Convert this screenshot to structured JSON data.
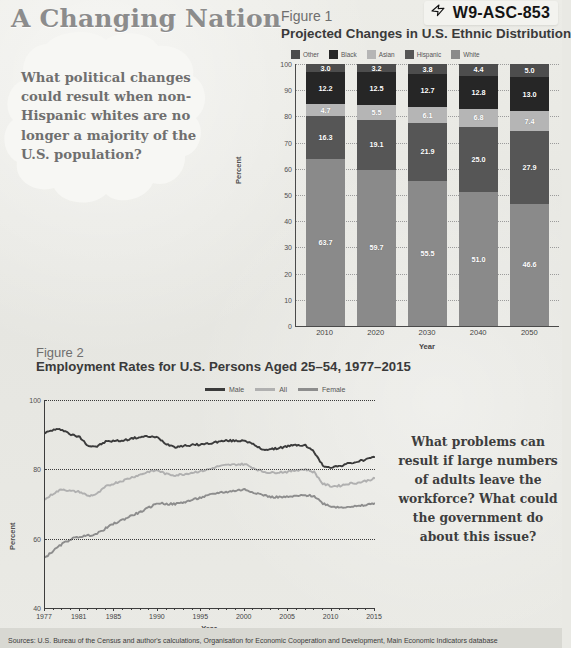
{
  "header": {
    "title": "A Changing Nation",
    "code_badge": {
      "icon": "pointing-hand-icon",
      "text": "W9-ASC-853"
    }
  },
  "bubble": {
    "question": "What political changes could result when non-Hispanic whites are no longer a majority of the U.S. population?"
  },
  "figure1": {
    "number": "Figure 1",
    "title": "Projected Changes in U.S. Ethnic Distribution",
    "legend": [
      {
        "label": "Other",
        "color": "#4d4d4d"
      },
      {
        "label": "Black",
        "color": "#262626"
      },
      {
        "label": "Asian",
        "color": "#b5b5b5"
      },
      {
        "label": "Hispanic",
        "color": "#565656"
      },
      {
        "label": "White",
        "color": "#8a8a8a"
      }
    ],
    "ylabel": "Percent",
    "xlabel": "Year",
    "yticks": [
      "100",
      "90",
      "80",
      "70",
      "60",
      "50",
      "40",
      "30",
      "20",
      "10",
      "0"
    ]
  },
  "figure2": {
    "number": "Figure 2",
    "title": "Employment Rates for U.S. Persons Aged 25–54, 1977–2015",
    "legend": [
      {
        "label": "Male",
        "color": "#3b3b3b"
      },
      {
        "label": "All",
        "color": "#b0b0b0"
      },
      {
        "label": "Female",
        "color": "#8d8d8d"
      }
    ],
    "ylabel": "Percent",
    "xlabel": "Year",
    "yticks": [
      "100",
      "80",
      "60",
      "40"
    ],
    "xticks": [
      "1977",
      "1981",
      "1985",
      "1990",
      "1995",
      "2000",
      "2005",
      "2010",
      "2015"
    ]
  },
  "question2": "What problems can result if large numbers of adults leave the workforce? What could the government do about this issue?",
  "sources": "Sources: U.S. Bureau of the Census and author's calculations, Organisation for Economic Cooperation and Development, Main Economic Indicators database",
  "chart_data": [
    {
      "type": "bar",
      "stacked": true,
      "title": "Projected Changes in U.S. Ethnic Distribution",
      "xlabel": "Year",
      "ylabel": "Percent",
      "ylim": [
        0,
        100
      ],
      "grid": true,
      "legend_position": "top",
      "categories": [
        "2010",
        "2020",
        "2030",
        "2040",
        "2050"
      ],
      "series": [
        {
          "name": "White",
          "color": "#8a8a8a",
          "values": [
            63.7,
            59.7,
            55.5,
            51.0,
            46.6
          ]
        },
        {
          "name": "Hispanic",
          "color": "#565656",
          "values": [
            16.3,
            19.1,
            21.9,
            25.0,
            27.9
          ]
        },
        {
          "name": "Asian",
          "color": "#b5b5b5",
          "values": [
            4.7,
            5.5,
            6.1,
            6.8,
            7.4
          ]
        },
        {
          "name": "Black",
          "color": "#262626",
          "values": [
            12.2,
            12.5,
            12.7,
            12.8,
            13.0
          ]
        },
        {
          "name": "Other",
          "color": "#4d4d4d",
          "values": [
            3.0,
            3.2,
            3.8,
            4.4,
            5.0
          ]
        }
      ]
    },
    {
      "type": "line",
      "title": "Employment Rates for U.S. Persons Aged 25–54, 1977–2015",
      "xlabel": "Year",
      "ylabel": "Percent",
      "xlim": [
        1977,
        2015
      ],
      "ylim": [
        40,
        100
      ],
      "grid": true,
      "legend_position": "top",
      "xticks": [
        1977,
        1981,
        1985,
        1990,
        1995,
        2000,
        2005,
        2010,
        2015
      ],
      "yticks": [
        40,
        60,
        80,
        100
      ],
      "x": [
        1977,
        1978,
        1979,
        1980,
        1981,
        1982,
        1983,
        1984,
        1985,
        1986,
        1987,
        1988,
        1989,
        1990,
        1991,
        1992,
        1993,
        1994,
        1995,
        1996,
        1997,
        1998,
        1999,
        2000,
        2001,
        2002,
        2003,
        2004,
        2005,
        2006,
        2007,
        2008,
        2009,
        2010,
        2011,
        2012,
        2013,
        2014,
        2015
      ],
      "series": [
        {
          "name": "Male",
          "color": "#3b3b3b",
          "values": [
            90.5,
            91.4,
            91.5,
            90.0,
            89.3,
            86.8,
            86.6,
            88.0,
            88.2,
            88.3,
            88.9,
            89.3,
            89.5,
            89.1,
            87.3,
            86.5,
            86.8,
            87.0,
            87.2,
            87.5,
            88.0,
            88.3,
            88.2,
            88.4,
            87.1,
            85.8,
            85.7,
            86.2,
            86.7,
            87.0,
            86.9,
            85.0,
            81.0,
            80.6,
            81.0,
            81.7,
            82.2,
            82.9,
            83.5
          ]
        },
        {
          "name": "All",
          "color": "#b0b0b0",
          "values": [
            71.3,
            73.1,
            74.3,
            73.7,
            73.5,
            72.3,
            72.9,
            75.0,
            76.0,
            76.8,
            77.7,
            78.5,
            79.4,
            79.7,
            78.6,
            78.3,
            78.6,
            79.1,
            79.5,
            80.1,
            80.9,
            81.2,
            81.4,
            81.5,
            80.4,
            79.4,
            79.0,
            79.2,
            79.3,
            79.8,
            80.0,
            79.2,
            75.8,
            75.1,
            75.3,
            75.9,
            76.1,
            76.7,
            77.4
          ]
        },
        {
          "name": "Female",
          "color": "#8d8d8d",
          "values": [
            54.5,
            56.6,
            58.5,
            59.9,
            60.6,
            60.9,
            61.4,
            63.0,
            64.4,
            65.5,
            66.7,
            67.7,
            69.0,
            70.3,
            70.0,
            70.0,
            70.5,
            71.2,
            71.9,
            72.6,
            73.3,
            73.5,
            73.9,
            74.2,
            73.4,
            72.7,
            72.0,
            72.0,
            72.0,
            72.3,
            72.5,
            72.3,
            70.2,
            69.3,
            69.0,
            69.3,
            69.3,
            69.7,
            70.3
          ]
        }
      ]
    }
  ]
}
